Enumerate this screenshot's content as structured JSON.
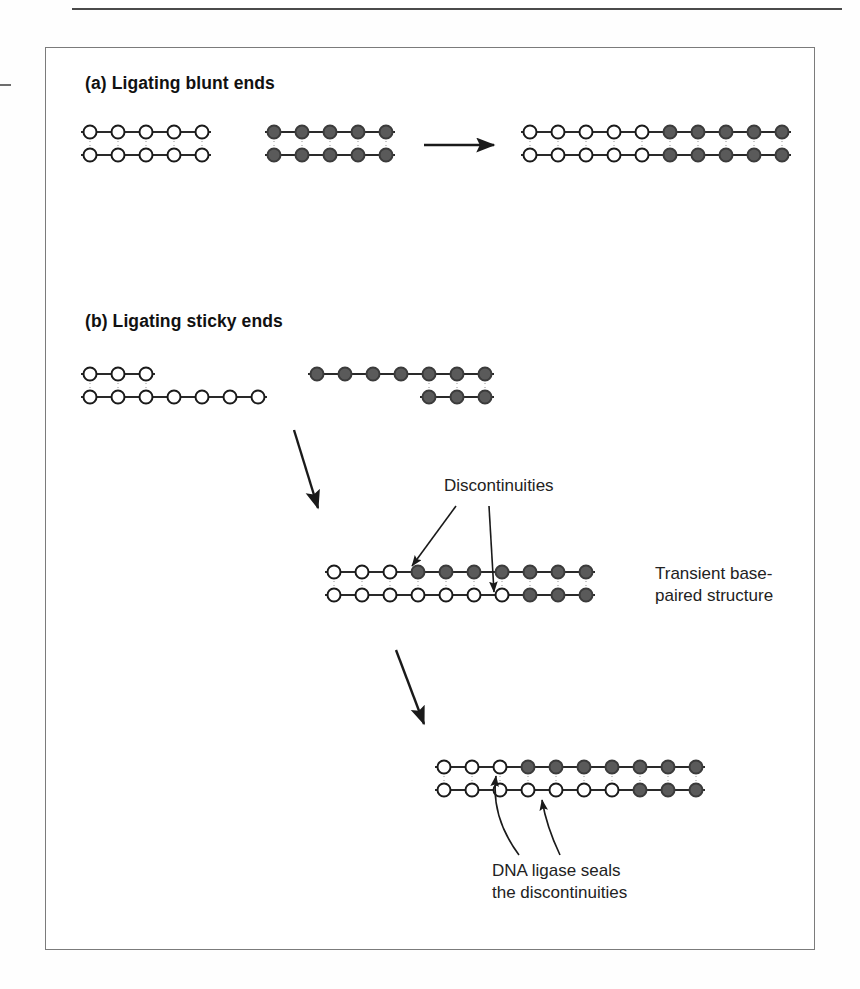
{
  "figure": {
    "panels": [
      {
        "id": "a",
        "title": "(a) Ligating blunt ends",
        "reactants": [
          {
            "name": "blunt-fragment-open",
            "fill": "open",
            "top_strand": 5,
            "bottom_strand": 5,
            "overhang": "none"
          },
          {
            "name": "blunt-fragment-filled",
            "fill": "filled",
            "top_strand": 5,
            "bottom_strand": 5,
            "overhang": "none"
          }
        ],
        "reaction_arrow": "straight-right-arrow",
        "product": {
          "name": "blunt-ligation-product",
          "top_strand": [
            {
              "fill": "open",
              "count": 5
            },
            {
              "fill": "filled",
              "count": 5
            }
          ],
          "bottom_strand": [
            {
              "fill": "open",
              "count": 5
            },
            {
              "fill": "filled",
              "count": 5
            }
          ]
        }
      },
      {
        "id": "b",
        "title": "(b) Ligating sticky ends",
        "reactants": [
          {
            "name": "sticky-fragment-open",
            "fill": "open",
            "top_strand": 3,
            "bottom_strand": 7,
            "overhang": "3-prime-recessed-top"
          },
          {
            "name": "sticky-fragment-filled",
            "fill": "filled",
            "top_strand": 7,
            "bottom_strand": 3,
            "overhang": "5-prime-recessed-bottom"
          }
        ],
        "intermediate": {
          "name": "transient-base-paired-structure",
          "label": "Transient base-\npaired structure",
          "label_line_1": "Transient base-",
          "label_line_2": "paired structure",
          "top_strand": [
            {
              "fill": "open",
              "count": 3
            },
            {
              "fill": "filled",
              "count": 7
            }
          ],
          "bottom_strand": [
            {
              "fill": "open",
              "count": 7
            },
            {
              "fill": "filled",
              "count": 3
            }
          ],
          "nick_label": "Discontinuities",
          "nick_count": 2,
          "nick_positions": [
            {
              "strand": "top",
              "after_index": 3
            },
            {
              "strand": "bottom",
              "after_index": 7
            }
          ]
        },
        "product": {
          "name": "sealed-ligation-product",
          "caption_line_1": "DNA ligase seals",
          "caption_line_2": "the discontinuities",
          "top_strand": [
            {
              "fill": "open",
              "count": 3
            },
            {
              "fill": "filled",
              "count": 7
            }
          ],
          "bottom_strand": [
            {
              "fill": "open",
              "count": 7
            },
            {
              "fill": "filled",
              "count": 3
            }
          ],
          "sealed_positions": [
            {
              "strand": "top",
              "after_index": 3
            },
            {
              "strand": "bottom",
              "after_index": 7
            }
          ]
        }
      }
    ],
    "colors": {
      "open_circle_fill": "#ffffff",
      "open_circle_stroke": "#1a1a1a",
      "filled_circle_fill": "#5a5a5a",
      "filled_circle_stroke": "#3b3b3b",
      "backbone": "#2a2a2a",
      "hydrogen_bond": "#2a2a2a",
      "frame": "#7b7b7b",
      "text": "#222222",
      "background": "#ffffff"
    },
    "geometry": {
      "circle_diameter": 13,
      "circle_spacing": 28,
      "strand_gap": 23
    }
  }
}
